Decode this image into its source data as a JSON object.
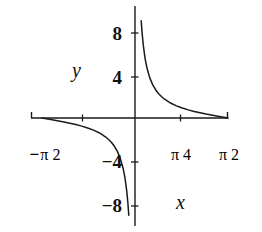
{
  "figure": {
    "title": "",
    "background_color": "#ffffff",
    "line_color": "#1a1a1a",
    "axis_color": "#1a1a1a"
  },
  "axis_labels": {
    "x_name": "x",
    "y_name": "y"
  },
  "y_ticks": [
    {
      "label": "8",
      "value": 8
    },
    {
      "label": "4",
      "value": 4
    },
    {
      "label": "−4",
      "value": -4
    },
    {
      "label": "−8",
      "value": -8
    }
  ],
  "x_ticks": [
    {
      "sign": "−",
      "numerator": "π",
      "denominator": "2",
      "label": "−π/2",
      "value": -1.5708
    },
    {
      "sign": "",
      "numerator": "π",
      "denominator": "4",
      "label": "π/4",
      "value": 0.7854
    },
    {
      "sign": "",
      "numerator": "π",
      "denominator": "2",
      "label": "π/2",
      "value": 1.5708
    }
  ],
  "chart_data": {
    "type": "line",
    "title": "",
    "xlabel": "x",
    "ylabel": "y",
    "xlim": [
      -1.5708,
      1.5708
    ],
    "ylim": [
      -10.7,
      10.7
    ],
    "grid": false,
    "legend": false,
    "function": "y = cot(x)",
    "asymptotes": {
      "vertical": [
        0
      ]
    },
    "series": [
      {
        "name": "cot(x) branch on (-pi/2, 0)",
        "x": [
          -1.5708,
          -1.4,
          -1.2,
          -1.0,
          -0.9,
          -0.8,
          -0.7,
          -0.6,
          -0.5,
          -0.45,
          -0.4,
          -0.35,
          -0.3,
          -0.25,
          -0.2,
          -0.17,
          -0.14,
          -0.12,
          -0.105
        ],
        "y": [
          0.0,
          -0.1691,
          -0.3888,
          -0.6421,
          -0.7936,
          -0.9712,
          -1.1872,
          -1.4617,
          -1.8305,
          -2.0702,
          -2.3652,
          -2.7395,
          -3.2327,
          -3.9163,
          -4.9332,
          -5.8256,
          -7.1045,
          -8.2933,
          -9.4936
        ]
      },
      {
        "name": "cot(x) branch on (0, pi/2)",
        "x": [
          0.105,
          0.12,
          0.14,
          0.17,
          0.2,
          0.25,
          0.3,
          0.35,
          0.4,
          0.45,
          0.5,
          0.6,
          0.7,
          0.7854,
          0.8,
          0.9,
          1.0,
          1.2,
          1.4,
          1.5708
        ],
        "y": [
          9.4936,
          8.2933,
          7.1045,
          5.8256,
          4.9332,
          3.9163,
          3.2327,
          2.7395,
          2.3652,
          2.0702,
          1.8305,
          1.4617,
          1.1872,
          1.0,
          0.9712,
          0.7936,
          0.6421,
          0.3888,
          0.1691,
          0.0
        ]
      }
    ],
    "y_tick_values": [
      8,
      4,
      -4,
      -8
    ],
    "x_tick_values": [
      -1.5708,
      0.7854,
      1.5708
    ],
    "x_tick_labels": [
      "−π/2",
      "π/4",
      "π/2"
    ],
    "y_tick_labels": [
      "8",
      "4",
      "−4",
      "−8"
    ]
  }
}
